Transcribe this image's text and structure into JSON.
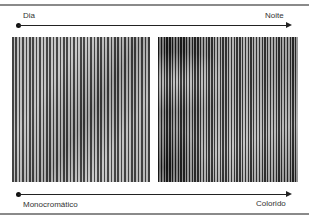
{
  "diagram": {
    "top_axis": {
      "start_label": "Dia",
      "end_label": "Noite"
    },
    "bottom_axis": {
      "start_label": "Monocromático",
      "end_label": "Colorido"
    },
    "panels": [
      {
        "name": "left-panel",
        "description": "monochrome striped image"
      },
      {
        "name": "right-panel",
        "description": "striped image with darker contrast"
      }
    ],
    "colors": {
      "frame_line": "#8a8a8a",
      "axis": "#222222",
      "text": "#333333"
    }
  }
}
